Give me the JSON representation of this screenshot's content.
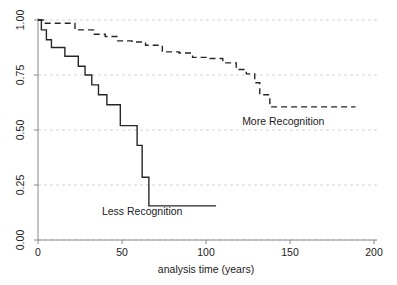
{
  "chart_data": {
    "type": "line",
    "subtype": "kaplan-meier-survival-step",
    "title": "",
    "xlabel": "analysis time (years)",
    "ylabel": "",
    "xlim": [
      0,
      200
    ],
    "ylim": [
      0,
      1.0
    ],
    "xticks": [
      0,
      50,
      100,
      150,
      200
    ],
    "xticklabels": [
      "0",
      "50",
      "100",
      "150",
      "200"
    ],
    "yticks": [
      0.0,
      0.25,
      0.5,
      0.75,
      1.0
    ],
    "yticklabels": [
      "0.00",
      "0.25",
      "0.50",
      "0.75",
      "1.00"
    ],
    "grid": "horizontal-dashed",
    "legend": "inline-annotations",
    "series": [
      {
        "name": "Less Recognition",
        "style": "solid",
        "label_x": 62,
        "label_y": 0.115,
        "points": [
          [
            0,
            1.0
          ],
          [
            2,
            0.955
          ],
          [
            5,
            0.91
          ],
          [
            8,
            0.875
          ],
          [
            13,
            0.875
          ],
          [
            16,
            0.835
          ],
          [
            21,
            0.835
          ],
          [
            24,
            0.79
          ],
          [
            28,
            0.75
          ],
          [
            32,
            0.705
          ],
          [
            36,
            0.66
          ],
          [
            41,
            0.615
          ],
          [
            46,
            0.615
          ],
          [
            49,
            0.52
          ],
          [
            56,
            0.52
          ],
          [
            59,
            0.43
          ],
          [
            62,
            0.285
          ],
          [
            66,
            0.155
          ],
          [
            106,
            0.155
          ]
        ]
      },
      {
        "name": "More Recognition",
        "style": "dashed",
        "label_x": 146,
        "label_y": 0.525,
        "points": [
          [
            0,
            1.0
          ],
          [
            3,
            0.985
          ],
          [
            18,
            0.985
          ],
          [
            22,
            0.955
          ],
          [
            28,
            0.955
          ],
          [
            33,
            0.935
          ],
          [
            40,
            0.925
          ],
          [
            47,
            0.905
          ],
          [
            56,
            0.9
          ],
          [
            64,
            0.885
          ],
          [
            74,
            0.855
          ],
          [
            84,
            0.85
          ],
          [
            92,
            0.83
          ],
          [
            100,
            0.825
          ],
          [
            110,
            0.805
          ],
          [
            118,
            0.775
          ],
          [
            124,
            0.755
          ],
          [
            129,
            0.715
          ],
          [
            132,
            0.66
          ],
          [
            138,
            0.605
          ],
          [
            189,
            0.605
          ]
        ]
      }
    ]
  },
  "axes": {
    "x_axis_name": "analysis-time-axis",
    "y_axis_name": "survival-probability-axis"
  }
}
